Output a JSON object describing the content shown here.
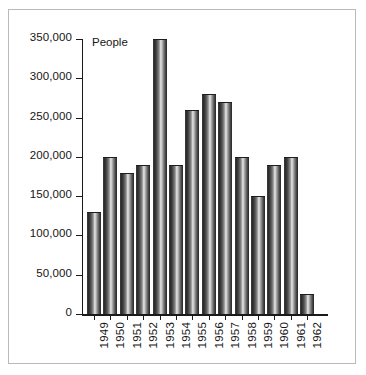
{
  "chart_data": {
    "type": "bar",
    "title": "",
    "unit_label": "People",
    "xlabel": "",
    "ylabel": "People",
    "grid": false,
    "legend": "none",
    "categories": [
      "1949",
      "1950",
      "1951",
      "1952",
      "1953",
      "1954",
      "1955",
      "1956",
      "1957",
      "1958",
      "1959",
      "1960",
      "1961",
      "1962"
    ],
    "values": [
      130000,
      200000,
      180000,
      190000,
      350000,
      190000,
      260000,
      280000,
      270000,
      200000,
      150000,
      190000,
      200000,
      25000
    ],
    "ylim": [
      0,
      350000
    ],
    "ytick_values": [
      0,
      50000,
      100000,
      150000,
      200000,
      250000,
      300000,
      350000
    ],
    "ytick_labels": [
      "0",
      "50,000",
      "100,000",
      "150,000",
      "200,000",
      "250,000",
      "300,000",
      "350,000"
    ],
    "series": [
      {
        "name": "People",
        "values": [
          130000,
          200000,
          180000,
          190000,
          350000,
          190000,
          260000,
          280000,
          270000,
          200000,
          150000,
          190000,
          200000,
          25000
        ]
      }
    ]
  },
  "style": {
    "axis_color": "#1a1a1a",
    "text_color": "#161616",
    "frame_color": "#b9b9b9",
    "background": "#ffffff",
    "bar_dark": "#2a2a2a",
    "bar_light": "#e8e8e8"
  }
}
